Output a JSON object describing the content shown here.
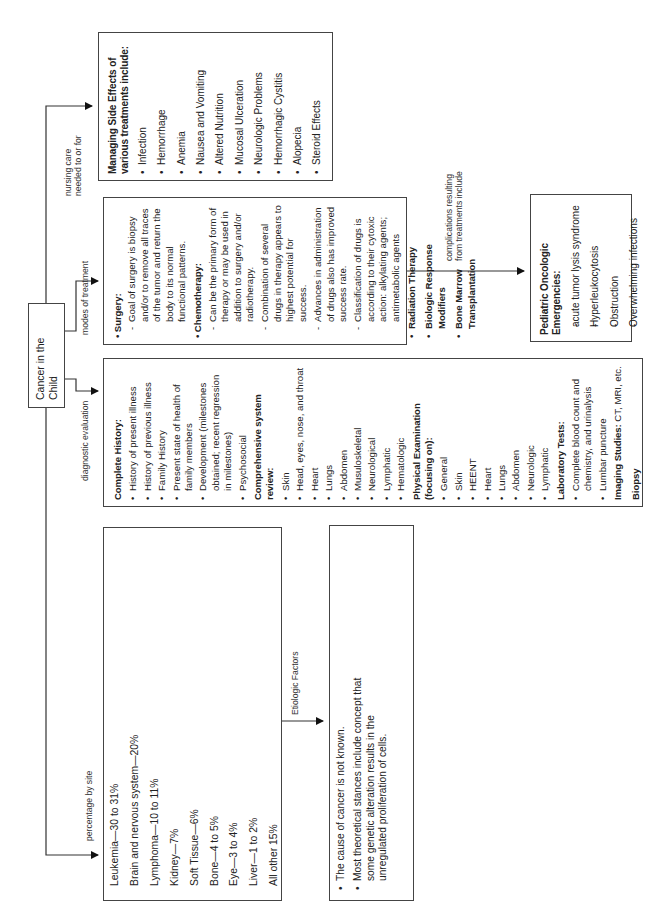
{
  "root": {
    "title": "Cancer in the Child"
  },
  "connectors": {
    "percentage_by_site": "percentage by site",
    "diagnostic_evaluation": "diagnostic evaluation",
    "modes_of_treatment": "modes of treatment",
    "nursing_care": [
      "nursing care",
      "needed to or for"
    ],
    "etiologic_factors": "Etiologic Factors",
    "complications": [
      "complications resulting",
      "from treatments include"
    ]
  },
  "sites": {
    "items": [
      "Leukemia—30 to 31%",
      "Brain and nervous system—20%",
      "Lymphoma—10 to 11%",
      "Kidney—7%",
      "Soft Tissue—6%",
      "Bone—4 to 5%",
      "Eye—3 to 4%",
      "Liver—1 to 2%",
      "All other 15%"
    ]
  },
  "etiologic": {
    "items": [
      "The cause of cancer is not known.",
      "Most theoretical stances include concept that some genetic alteration results in the unregulated proliferation of cells."
    ]
  },
  "diagnostic": {
    "complete_history": {
      "heading": "Complete History:",
      "items": [
        "History of present illness",
        "History of previous illness",
        "Family History",
        "Present state of health of family members",
        "Development (milestones obtained; recent regression in milestones)",
        "Psychosocial"
      ]
    },
    "system_review": {
      "heading": "Comprehensive system review:",
      "items": [
        "Skin",
        "Head, eyes, nose, and throat",
        "Heart",
        "Lungs",
        "Abdomen",
        "Musuloskeletal",
        "Neurological",
        "Lymphatic",
        "Hematologic"
      ]
    },
    "physical_exam": {
      "heading": "Physical Examination (focusing on):",
      "items": [
        "General",
        "Skin",
        "HEENT",
        "Heart",
        "Lungs",
        "Abdomen",
        "Neurologic",
        "Lymphatic"
      ]
    },
    "lab_tests": {
      "heading": "Laboratory Tests:",
      "items": [
        "Complete blood count and chemistry, and urinalysis",
        "Lumbar puncture"
      ]
    },
    "imaging": {
      "heading": "Imaging Studies:",
      "text": " CT, MRI, etc."
    },
    "biopsy": "Biopsy"
  },
  "treatment": {
    "surgery": {
      "heading": "Surgery:",
      "items": [
        "Goal of surgery is biopsy and/or to remove all traces of the tumor and return the body to its normal functional patterns."
      ]
    },
    "chemotherapy": {
      "heading": "Chemotherapy:",
      "items": [
        "Can be the primary form of therapy or may be used in addition to surgery and/or radiotherapy.",
        "Combination of several drugs in therapy appears to highest potential for success.",
        "Advances in administration of drugs also has improved success rate.",
        "Classification of drugs is according to their cytoxic action: alkylating agents; antimetabolic agents"
      ]
    },
    "others": [
      "Radiation Therapy",
      "Biologic Response Modifiers",
      "Bone Marrow Transplantation"
    ]
  },
  "emergencies": {
    "heading": "Pediatric Oncologic Emergencies:",
    "items": [
      "acute tumor lysis syndrome",
      "Hyperleukocytosis",
      "Obstruction",
      "Overwhelming infections"
    ]
  },
  "side_effects": {
    "heading": "Managing Side Effects of various treatments include:",
    "items": [
      "Infection",
      "Hemorrhage",
      "Anemia",
      "Nausea and Vomiting",
      "Altered Nutrition",
      "Mucosal Ulceration",
      "Neurologic Problems",
      "Hemorrhagic Cystitis",
      "Alopecia",
      "Steroid Effects"
    ]
  }
}
